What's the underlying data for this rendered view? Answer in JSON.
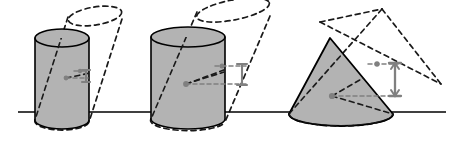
{
  "figure": {
    "title": "Cavalieri principle illustration: three solids with sheared copies",
    "canvas": {
      "width": 462,
      "height": 142,
      "background": "#ffffff"
    },
    "style": {
      "solid_fill": "#b3b3b3",
      "solid_stroke": "#000000",
      "solid_stroke_width": 1.6,
      "dashed_stroke": "#1a1a1a",
      "dashed_stroke_width": 1.7,
      "dash_pattern": "5,4",
      "ground_line_color": "#000000",
      "ground_line_width": 1.4,
      "center_dot_color": "#808080",
      "arrow_color": "#808080",
      "arrow_width": 2.2
    },
    "ground_line": {
      "x1": 18,
      "y1": 112,
      "x2": 446,
      "y2": 112
    },
    "figures": [
      {
        "name": "cylinder-small",
        "shape": "cylinder",
        "label": "upright small cylinder",
        "top_ellipse": {
          "cx": 62,
          "cy": 38,
          "rx": 27,
          "ry": 9
        },
        "bottom_ellipse": {
          "cx": 62,
          "cy": 120,
          "rx": 27,
          "ry": 9
        },
        "height": 82,
        "shear": {
          "dx": 33,
          "dy": -22,
          "label": "sheared copy offset"
        }
      },
      {
        "name": "cylinder-large",
        "shape": "cylinder",
        "label": "upright large cylinder",
        "top_ellipse": {
          "cx": 188,
          "cy": 37,
          "rx": 37,
          "ry": 10
        },
        "bottom_ellipse": {
          "cx": 188,
          "cy": 119,
          "rx": 37,
          "ry": 10
        },
        "height": 82,
        "shear": {
          "dx": 45,
          "dy": -28,
          "label": "sheared copy offset"
        }
      },
      {
        "name": "cone",
        "shape": "cone",
        "label": "upright cone",
        "apex": {
          "x": 330,
          "y": 38
        },
        "base_ellipse": {
          "cx": 341,
          "cy": 114,
          "rx": 52,
          "ry": 12
        },
        "height": 76,
        "shear": {
          "dx": 52,
          "dy": -30,
          "label": "sheared copy offset"
        }
      }
    ],
    "height_markers": [
      {
        "name": "height-marker-1",
        "x": 85,
        "y_top": 70,
        "y_bottom": 82,
        "length": 12
      },
      {
        "name": "height-marker-2",
        "x": 241,
        "y_top": 63,
        "y_bottom": 84,
        "length": 21
      },
      {
        "name": "height-marker-3",
        "x": 390,
        "y_top": 62,
        "y_bottom": 95,
        "length": 33
      }
    ],
    "center_dots": [
      {
        "name": "center-dot-solid-1",
        "cx": 66,
        "cy": 78,
        "r": 2.4
      },
      {
        "name": "center-dot-copy-1",
        "cx": 82,
        "cy": 71,
        "r": 2.2
      },
      {
        "name": "center-dot-solid-2",
        "cx": 186,
        "cy": 84,
        "r": 2.8
      },
      {
        "name": "center-dot-copy-2",
        "cx": 226,
        "cy": 66,
        "r": 2.4
      },
      {
        "name": "center-dot-solid-3",
        "cx": 332,
        "cy": 96,
        "r": 3.0
      },
      {
        "name": "center-dot-copy-3",
        "cx": 380,
        "cy": 64,
        "r": 2.6
      }
    ]
  }
}
